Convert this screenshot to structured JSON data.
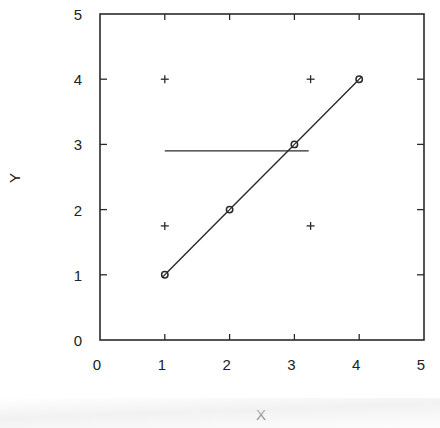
{
  "chart_data": {
    "type": "scatter",
    "title": "",
    "xlabel": "X",
    "ylabel": "Y",
    "xlim": [
      0,
      5
    ],
    "ylim": [
      0,
      5
    ],
    "xticks": [
      0,
      1,
      2,
      3,
      4,
      5
    ],
    "yticks": [
      0,
      1,
      2,
      3,
      4,
      5
    ],
    "grid": false,
    "legend": null,
    "series": [
      {
        "name": "circles-line",
        "type": "line",
        "marker": "circle",
        "x": [
          1,
          2,
          3,
          4
        ],
        "y": [
          1,
          2,
          3,
          4
        ]
      },
      {
        "name": "plus-points",
        "type": "scatter",
        "marker": "plus",
        "x": [
          1,
          3.25,
          1,
          3.25
        ],
        "y": [
          4,
          4,
          1.75,
          1.75
        ]
      },
      {
        "name": "horizontal-line",
        "type": "line",
        "marker": "none",
        "x": [
          1,
          3.22
        ],
        "y": [
          2.9,
          2.9
        ]
      }
    ]
  },
  "axes": {
    "x_label": "X",
    "y_label": "Y",
    "x_tick_labels": [
      "0",
      "1",
      "2",
      "3",
      "4",
      "5"
    ],
    "y_tick_labels": [
      "0",
      "1",
      "2",
      "3",
      "4",
      "5"
    ]
  }
}
